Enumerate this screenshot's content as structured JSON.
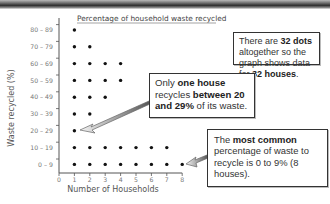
{
  "chart_data": {
    "type": "scatter",
    "subtype": "dot-plot",
    "title": "Percentage of household waste recycled",
    "xlabel": "Number of Households",
    "ylabel": "Waste recycled (%)",
    "x_ticks": [
      "0",
      "1",
      "2",
      "3",
      "4",
      "5",
      "6",
      "7",
      "8"
    ],
    "xlim": [
      0,
      8
    ],
    "categories": [
      "80 – 89",
      "70 – 79",
      "60 – 69",
      "50 – 59",
      "40 – 49",
      "30 – 39",
      "20 – 29",
      "10 – 19",
      "0 – 9"
    ],
    "values": [
      1,
      2,
      4,
      4,
      3,
      2,
      1,
      7,
      8
    ],
    "total_dots": 32,
    "grid": false
  },
  "annotations": {
    "total": {
      "parts": [
        {
          "text": "There are ",
          "bold": false
        },
        {
          "text": "32 dots",
          "bold": true
        },
        {
          "text": " altogether so the graph shows data for ",
          "bold": false
        },
        {
          "text": "32 houses",
          "bold": true
        },
        {
          "text": ".",
          "bold": false
        }
      ]
    },
    "one_house": {
      "parts": [
        {
          "text": "Only ",
          "bold": false
        },
        {
          "text": "one house",
          "bold": true
        },
        {
          "text": " recycles ",
          "bold": false
        },
        {
          "text": "between 20 and 29%",
          "bold": true
        },
        {
          "text": " of its waste.",
          "bold": false
        }
      ]
    },
    "most_common": {
      "parts": [
        {
          "text": "The ",
          "bold": false
        },
        {
          "text": "most common",
          "bold": true
        },
        {
          "text": " percentage of waste to recycle is 0 to 9% (8 houses).",
          "bold": false
        }
      ]
    }
  }
}
